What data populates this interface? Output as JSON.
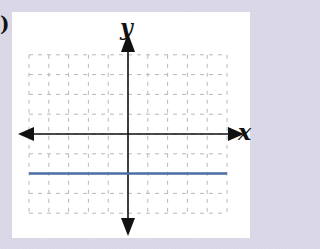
{
  "problem_label": ")",
  "chart_data": {
    "type": "line",
    "title": "",
    "xlabel": "x",
    "ylabel": "y",
    "xlim": [
      -5,
      5
    ],
    "ylim": [
      -4,
      4
    ],
    "grid": true,
    "grid_style": "dashed",
    "series": [
      {
        "name": "y = -2",
        "equation": "y = -2",
        "x": [
          -5,
          5
        ],
        "y": [
          -2,
          -2
        ],
        "color": "#4a6fa5"
      }
    ]
  },
  "colors": {
    "background": "#d9d7e6",
    "panel": "#ffffff",
    "grid": "#b8b8b8",
    "axis": "#111111",
    "line": "#4a6fa5"
  }
}
